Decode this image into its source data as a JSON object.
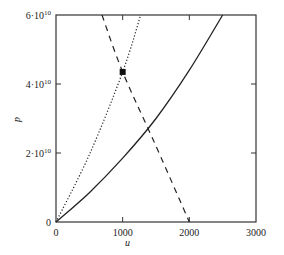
{
  "chart_data": {
    "type": "line",
    "title": "",
    "xlabel": "u",
    "ylabel": "p",
    "xlim": [
      0,
      3000
    ],
    "ylim": [
      0,
      60000000000.0
    ],
    "grid": false,
    "legend": null,
    "x_ticks": [
      {
        "value": 0,
        "label": "0"
      },
      {
        "value": 1000,
        "label": "1000"
      },
      {
        "value": 2000,
        "label": "2000"
      },
      {
        "value": 3000,
        "label": "3000"
      }
    ],
    "y_ticks": [
      {
        "value": 0,
        "label": "0",
        "sup": ""
      },
      {
        "value": 20000000000.0,
        "label": "2·10",
        "sup": "10"
      },
      {
        "value": 40000000000.0,
        "label": "4·10",
        "sup": "10"
      },
      {
        "value": 60000000000.0,
        "label": "6·10",
        "sup": "10"
      }
    ],
    "series": [
      {
        "name": "solid",
        "style": "solid",
        "points": [
          [
            0,
            0
          ],
          [
            500,
            8500000000.0
          ],
          [
            1000,
            18500000000.0
          ],
          [
            1500,
            30000000000.0
          ],
          [
            2000,
            44000000000.0
          ],
          [
            2500,
            60000000000.0
          ]
        ]
      },
      {
        "name": "dotted",
        "style": "dotted",
        "points": [
          [
            0,
            0
          ],
          [
            500,
            19500000000.0
          ],
          [
            1000,
            43500000000.0
          ],
          [
            1270,
            60000000000.0
          ]
        ]
      },
      {
        "name": "dashed",
        "style": "dashed",
        "points": [
          [
            690,
            60000000000.0
          ],
          [
            1000,
            43500000000.0
          ],
          [
            1500,
            22000000000.0
          ],
          [
            2000,
            0
          ]
        ]
      }
    ],
    "annotations": [
      {
        "type": "marker",
        "shape": "square",
        "x": 1000,
        "y": 43500000000.0
      }
    ]
  }
}
